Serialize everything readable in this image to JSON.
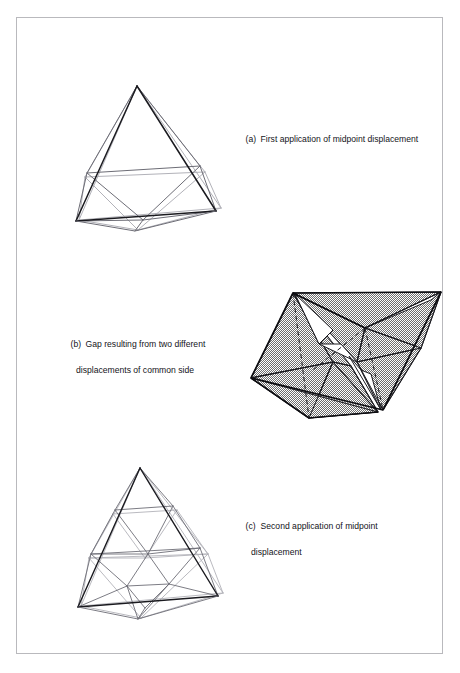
{
  "page": {
    "running_header_fragment": "· , , ·",
    "background_color": "#ffffff",
    "frame_border_color": "#b9b9bd"
  },
  "captions": [
    {
      "id": "a",
      "tag": "(a)",
      "line1": "First application of midpoint displacement",
      "line2": ""
    },
    {
      "id": "b",
      "tag": "(b)",
      "line1": "Gap resulting from two different",
      "line2": "displacements of common side"
    },
    {
      "id": "c",
      "tag": "(c)",
      "line1": "Second application of midpoint",
      "line2": "displacement"
    }
  ],
  "figures": {
    "a": {
      "name": "tetrahedron-first-subdivision",
      "description": "Wireframe tetrahedron after one midpoint displacement step",
      "line_colors": {
        "front": "#1a1a1f",
        "mid": "#6d6d76",
        "back": "#b2b2b9"
      }
    },
    "b": {
      "name": "gap-between-displaced-faces",
      "description": "Two shaded subdivided triangles meeting along a common side with a visible gap",
      "fill_style": "50% dither gray",
      "fill_color": "#808080",
      "gap_color": "#ffffff",
      "hidden_edge_style": "dashed",
      "outline_color": "#0d0d11"
    },
    "c": {
      "name": "tetrahedron-second-subdivision",
      "description": "Wireframe tetrahedron after two midpoint displacement steps",
      "line_colors": {
        "front": "#1a1a1f",
        "mid": "#6d6d76",
        "back": "#b2b2b9"
      }
    }
  }
}
